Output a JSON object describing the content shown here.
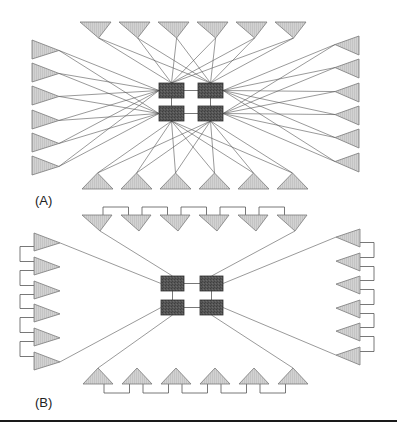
{
  "figure": {
    "panels": [
      {
        "id": "A",
        "label": "(A)",
        "label_pos": [
          35,
          193
        ],
        "topology": "fully-connected",
        "squares": [
          [
            159,
            83,
            25,
            15
          ],
          [
            198,
            83,
            25,
            15
          ],
          [
            159,
            106,
            25,
            15
          ],
          [
            198,
            106,
            25,
            15
          ]
        ],
        "triangles": {
          "top": {
            "xs": [
              80,
              119,
              158,
              197,
              236,
              275
            ],
            "y": 22,
            "w": 31,
            "h": 16,
            "dir": "down"
          },
          "bottom": {
            "xs": [
              82,
              121,
              160,
              199,
              238,
              277
            ],
            "y": 173,
            "w": 31,
            "h": 16,
            "dir": "up"
          },
          "left": {
            "ys": [
              40,
              63,
              86,
              110,
              133,
              156
            ],
            "x": 32,
            "w": 27,
            "h": 19,
            "dir": "right"
          },
          "right": {
            "ys": [
              36,
              59,
              83,
              106,
              129,
              153
            ],
            "x": 335,
            "w": 24,
            "h": 19,
            "dir": "left"
          }
        }
      },
      {
        "id": "B",
        "label": "(B)",
        "label_pos": [
          35,
          395
        ],
        "topology": "daisy-chain",
        "squares": [
          [
            161,
            276,
            23,
            15
          ],
          [
            200,
            276,
            23,
            15
          ],
          [
            161,
            300,
            23,
            15
          ],
          [
            200,
            300,
            23,
            15
          ]
        ],
        "triangles": {
          "top": {
            "xs": [
              82,
              121,
              160,
              199,
              238,
              277
            ],
            "y": 215,
            "w": 30,
            "h": 16,
            "dir": "down",
            "bus": 207
          },
          "bottom": {
            "xs": [
              83,
              122,
              161,
              200,
              239,
              278
            ],
            "y": 368,
            "w": 30,
            "h": 16,
            "dir": "up",
            "bus": 393
          },
          "left": {
            "ys": [
              233,
              257,
              281,
              304,
              328,
              352
            ],
            "x": 34,
            "w": 26,
            "h": 18,
            "dir": "right",
            "bus": 20
          },
          "right": {
            "ys": [
              229,
              253,
              276,
              300,
              323,
              347
            ],
            "x": 336,
            "w": 24,
            "h": 18,
            "dir": "left",
            "bus": 374
          }
        }
      }
    ],
    "colors": {
      "triangle_fill": "#cfcfcf",
      "triangle_stroke": "#7a7a7a",
      "square_fill": "#505050",
      "square_stroke": "#333333",
      "line": "#555555",
      "rule": "#1a1a1a"
    }
  }
}
